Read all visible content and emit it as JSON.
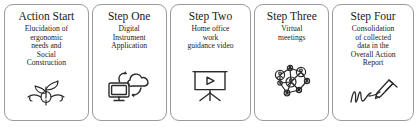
{
  "diagram": {
    "type": "process-flow",
    "orientation": "horizontal",
    "card_count": 5,
    "colors": {
      "card_border": "#9a9a9a",
      "card_background": "#ffffff",
      "text": "#1a1a1a",
      "icon_stroke": "#2b2b2b"
    },
    "cards": [
      {
        "title": "Action Start",
        "body": "Elucidation of\nergonomic\nneeds and\nSocial\nConstruction",
        "icon_name": "sprout-plant-icon"
      },
      {
        "title": "Step One",
        "body": "Digital\nInstrument\nApplication",
        "icon_name": "cloud-monitor-sync-icon"
      },
      {
        "title": "Step Two",
        "body": "Home office\nwork\nguidance video",
        "icon_name": "projector-screen-play-icon"
      },
      {
        "title": "Step Three",
        "body": "Virtual\nmeetings",
        "icon_name": "people-network-icon"
      },
      {
        "title": "Step Four",
        "body": "Consolidation\nof collected\ndata in the\nOverall Action\nReport",
        "icon_name": "signature-pen-icon"
      }
    ]
  }
}
